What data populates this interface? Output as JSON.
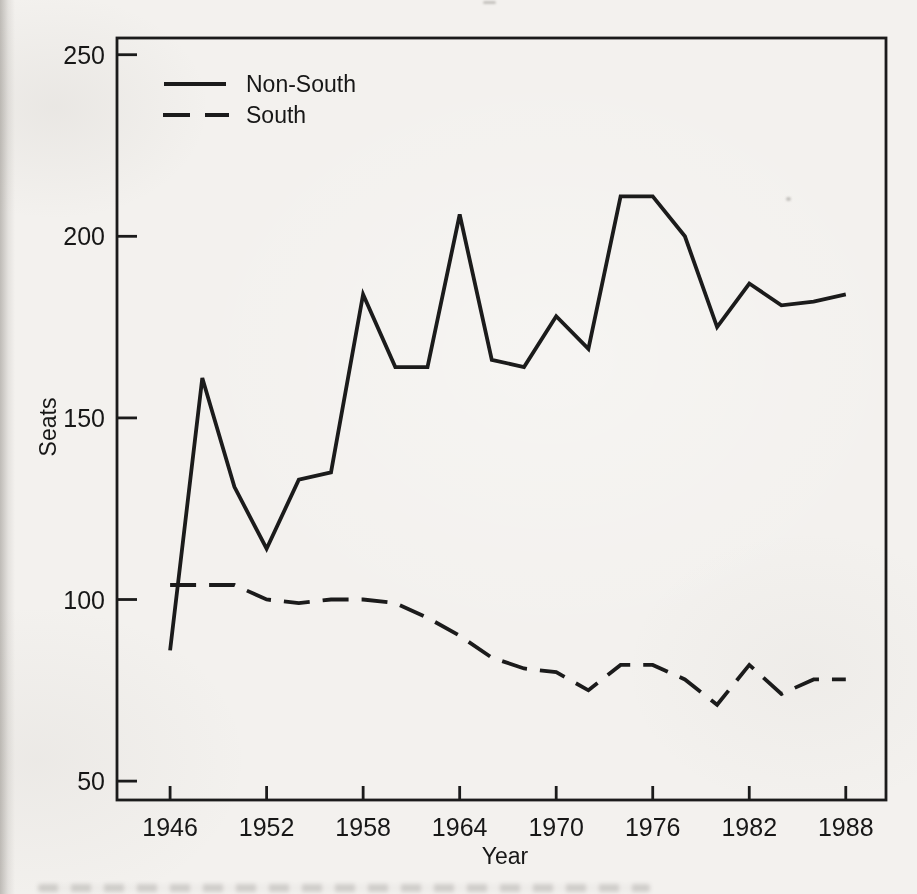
{
  "chart_data": {
    "type": "line",
    "title": "",
    "xlabel": "Year",
    "ylabel": "Seats",
    "x": [
      1946,
      1948,
      1950,
      1952,
      1954,
      1956,
      1958,
      1960,
      1962,
      1964,
      1966,
      1968,
      1970,
      1972,
      1974,
      1976,
      1978,
      1980,
      1982,
      1984,
      1986,
      1988
    ],
    "series": [
      {
        "name": "Non-South",
        "line_style": "solid",
        "values": [
          86,
          161,
          131,
          114,
          133,
          135,
          184,
          164,
          164,
          206,
          166,
          164,
          178,
          169,
          211,
          211,
          200,
          175,
          187,
          181,
          182,
          184
        ]
      },
      {
        "name": "South",
        "line_style": "dashed",
        "values": [
          104,
          104,
          104,
          100,
          99,
          100,
          100,
          99,
          95,
          90,
          84,
          81,
          80,
          75,
          82,
          82,
          78,
          71,
          82,
          74,
          78,
          78
        ]
      }
    ],
    "xticks": [
      1946,
      1952,
      1958,
      1964,
      1970,
      1976,
      1982,
      1988
    ],
    "yticks": [
      250,
      200,
      150,
      100,
      50
    ],
    "xlim": [
      1942.7,
      1990.5
    ],
    "ylim": [
      44.8,
      254.6
    ],
    "grid": false,
    "legend_position": "top-left"
  },
  "colors": {
    "ink": "#1b1b1b",
    "paper": "#f3f1ee"
  }
}
